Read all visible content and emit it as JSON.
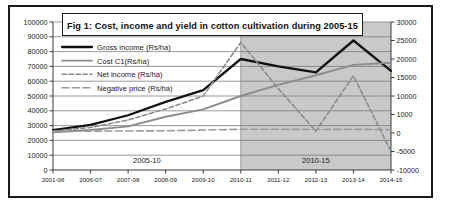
{
  "figure": {
    "title": "Fig 1: Cost, income and yield in cotton cultivation during 2005-15",
    "border_color": "#1a1a1a",
    "background": "#ffffff",
    "shaded_band_color": "#c9c9c9"
  },
  "chart_data": {
    "type": "line",
    "title": "Fig 1: Cost, income and yield in cotton cultivation during 2005-15",
    "xlabel": "",
    "ylabel": "",
    "grid": true,
    "legend_position": "top-left",
    "categories": [
      "2001-06",
      "2006-07",
      "2007-08",
      "2008-09",
      "2009-10",
      "2010-11",
      "2011-12",
      "2012-13",
      "2013-14",
      "2014-15"
    ],
    "left_axis": {
      "label": "",
      "ylim": [
        0,
        100000
      ],
      "tick_step": 10000,
      "ticks": [
        "0",
        "10000",
        "20000",
        "30000",
        "40000",
        "50000",
        "60000",
        "70000",
        "80000",
        "90000",
        "100000"
      ]
    },
    "right_axis": {
      "label": "",
      "ylim": [
        -10000,
        30000
      ],
      "tick_step": 5000,
      "ticks": [
        "-10000",
        "-5000",
        "0",
        "1000",
        "10000",
        "15000",
        "20000",
        "25000",
        "30000"
      ]
    },
    "band_labels": [
      {
        "text": "2005-10",
        "from": "2001-06",
        "to": "2010-11",
        "shaded": false
      },
      {
        "text": "2010-15",
        "from": "2010-11",
        "to": "2014-15",
        "shaded": true
      }
    ],
    "series": [
      {
        "name": "Gross income (Rs/ha)",
        "axis": "left",
        "style": "solid",
        "color": "#111111",
        "width": 2.3,
        "values": [
          27000,
          30500,
          37000,
          46000,
          54000,
          75000,
          70000,
          66000,
          87500,
          67000
        ]
      },
      {
        "name": "Cost C1(Rs/ha)",
        "axis": "left",
        "style": "solid",
        "color": "#8c8c8c",
        "width": 1.9,
        "values": [
          25500,
          27000,
          29500,
          36000,
          41000,
          50000,
          57500,
          64000,
          71000,
          72500
        ]
      },
      {
        "name": "Net income (Rs/ha)",
        "axis": "right",
        "style": "dotted-dash",
        "color": "#8a8a8a",
        "width": 1.6,
        "values": [
          500,
          1500,
          3500,
          6500,
          10000,
          24500,
          12000,
          500,
          15500,
          -5000
        ]
      },
      {
        "name": "Negative price (Rs/ha)",
        "axis": "right",
        "style": "dashed",
        "color": "#9a9a9a",
        "width": 1.6,
        "values": [
          400,
          500,
          550,
          600,
          800,
          1000,
          1000,
          950,
          1000,
          900
        ]
      }
    ]
  },
  "legend": {
    "items": [
      {
        "label": "Gross income (Rs/ha)",
        "swatch": "solid-black"
      },
      {
        "label": "Cost C1(Rs/ha)",
        "swatch": "solid-gray"
      },
      {
        "label": "Net income (Rs/ha)",
        "swatch": "dotted-dash-gray"
      },
      {
        "label": "Negative price (Rs/ha)",
        "swatch": "dashed-gray"
      }
    ]
  }
}
